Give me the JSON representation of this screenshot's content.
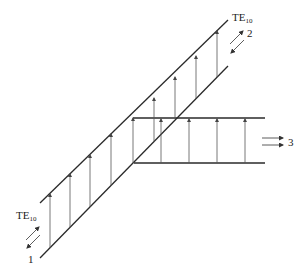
{
  "diagram": {
    "type": "waveguide-y-junction-field-pattern",
    "mode_label_top": "TE",
    "mode_label_top_sub": "10",
    "mode_label_bottom": "TE",
    "mode_label_bottom_sub": "10",
    "ports": [
      {
        "id": "port-1",
        "label": "1"
      },
      {
        "id": "port-2",
        "label": "2"
      },
      {
        "id": "port-3",
        "label": "3"
      }
    ],
    "colors": {
      "wall": "#2a2a2a",
      "field_line": "#555555",
      "background": "#ffffff"
    }
  }
}
